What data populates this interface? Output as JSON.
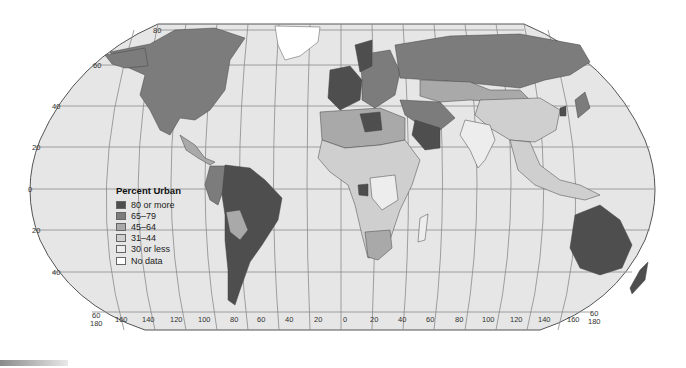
{
  "map": {
    "title": "Percent Urban",
    "projection": "Robinson world map",
    "ocean_color": "#e6e6e6",
    "outline_color": "#555555",
    "latitude_labels_left": [
      "80",
      "60",
      "40",
      "20",
      "0",
      "20",
      "40"
    ],
    "latitude_labels_right_bottom": [
      "60",
      "180"
    ],
    "longitude_labels": [
      "160",
      "140",
      "120",
      "100",
      "80",
      "60",
      "40",
      "20",
      "0",
      "20",
      "40",
      "60",
      "80",
      "100",
      "120",
      "140",
      "160"
    ],
    "bottom_left_corner_labels": [
      "60",
      "180"
    ]
  },
  "legend": {
    "title": "Percent Urban",
    "items": [
      {
        "label": "80 or more",
        "color": "#4e4e4e"
      },
      {
        "label": "65–79",
        "color": "#7c7c7c"
      },
      {
        "label": "45–64",
        "color": "#a9a9a9"
      },
      {
        "label": "31–44",
        "color": "#cfcfcf"
      },
      {
        "label": "30 or less",
        "color": "#ededed"
      },
      {
        "label": "No data",
        "color": "#ffffff"
      }
    ]
  },
  "regions": [
    {
      "name": "North America (US/Canada)",
      "category": "65–79"
    },
    {
      "name": "Mexico",
      "category": "65–79"
    },
    {
      "name": "Central America",
      "category": "45–64"
    },
    {
      "name": "Greenland",
      "category": "No data"
    },
    {
      "name": "Brazil/Argentina/Chile/Venezuela",
      "category": "80 or more"
    },
    {
      "name": "Colombia/Peru",
      "category": "65–79"
    },
    {
      "name": "Bolivia/Paraguay",
      "category": "45–64"
    },
    {
      "name": "Western Europe",
      "category": "80 or more"
    },
    {
      "name": "Europe (other)",
      "category": "65–79"
    },
    {
      "name": "Russia",
      "category": "65–79"
    },
    {
      "name": "Kazakhstan/Central Asia",
      "category": "45–64"
    },
    {
      "name": "Mongolia",
      "category": "45–64"
    },
    {
      "name": "China",
      "category": "31–44"
    },
    {
      "name": "India",
      "category": "30 or less"
    },
    {
      "name": "Saudi Arabia",
      "category": "80 or more"
    },
    {
      "name": "Middle East (other)",
      "category": "65–79"
    },
    {
      "name": "North Africa",
      "category": "45–64"
    },
    {
      "name": "Libya",
      "category": "80 or more"
    },
    {
      "name": "Sub-Saharan Africa",
      "category": "31–44"
    },
    {
      "name": "Central Africa",
      "category": "30 or less"
    },
    {
      "name": "Gabon",
      "category": "80 or more"
    },
    {
      "name": "South Africa",
      "category": "45–64"
    },
    {
      "name": "Japan",
      "category": "65–79"
    },
    {
      "name": "South Korea",
      "category": "80 or more"
    },
    {
      "name": "Southeast Asia",
      "category": "31–44"
    },
    {
      "name": "Australia",
      "category": "80 or more"
    },
    {
      "name": "New Zealand",
      "category": "80 or more"
    },
    {
      "name": "Papua New Guinea",
      "category": "30 or less"
    }
  ]
}
